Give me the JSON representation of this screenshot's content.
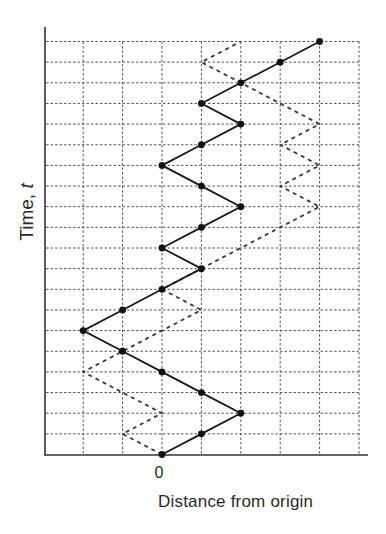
{
  "chart_data": {
    "type": "line",
    "title": "",
    "xlabel": "Distance from origin",
    "ylabel_prefix": "Time, ",
    "ylabel_var": "t",
    "ylabel": "Time, t",
    "x_tick_labels": [
      {
        "value": 0,
        "label": "0"
      }
    ],
    "x_grid_values": [
      -2,
      -1,
      0,
      1,
      2,
      3,
      4,
      5
    ],
    "xlim": [
      -3,
      5.2
    ],
    "ylim": [
      0,
      20
    ],
    "t_steps": 20,
    "grid": true,
    "legend": null,
    "series": [
      {
        "name": "random walk (solid)",
        "style": "solid",
        "markers": true,
        "t": [
          0,
          1,
          2,
          3,
          4,
          5,
          6,
          7,
          8,
          9,
          10,
          11,
          12,
          13,
          14,
          15,
          16,
          17,
          18,
          19,
          20
        ],
        "x": [
          0,
          1,
          2,
          1,
          0,
          -1,
          -2,
          -1,
          0,
          1,
          0,
          1,
          2,
          1,
          0,
          1,
          2,
          1,
          2,
          3,
          4
        ]
      },
      {
        "name": "random walk (dashed)",
        "style": "dashed",
        "markers": false,
        "t": [
          0,
          1,
          2,
          3,
          4,
          5,
          6,
          7,
          8,
          9,
          10,
          11,
          12,
          13,
          14,
          15,
          16,
          17,
          18,
          19,
          20
        ],
        "x": [
          0,
          -1,
          0,
          -1,
          -2,
          -1,
          0,
          1,
          0,
          1,
          2,
          3,
          4,
          3,
          4,
          3,
          4,
          3,
          2,
          1,
          2
        ]
      }
    ],
    "colors": {
      "axis": "#333333",
      "grid": "#555555",
      "solid_line": "#1a1a1a",
      "dashed_line": "#3a3a3a",
      "marker": "#111111"
    }
  }
}
